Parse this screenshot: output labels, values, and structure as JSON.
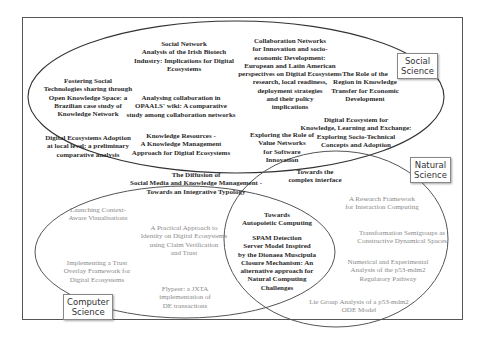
{
  "diagram": {
    "type": "venn",
    "sets": [
      {
        "id": "social",
        "label": "Social Science"
      },
      {
        "id": "natural",
        "label": "Natural Science"
      },
      {
        "id": "computer",
        "label": "Computer Science"
      }
    ],
    "social_only": [
      "Social Network Analysis of the Irish Biotech Industry: Implications for Digital Ecosystems",
      "Collaboration Networks for Innovation and socio-economic Development: European and Latin American perspectives on Digital Ecosystems research, local readiness, deployment strategies and their policy implications",
      "Fostering Social Technologies sharing through Open Knowledge Space: a Brazilian case study of Knowledge Network",
      "Analysing collaboration in OPAALS' wiki: A comparative study among collaboration networks",
      "The Role of the Region in Knowledge Transfer for Economic Development",
      "Digital Ecosystem for Knowledge, Learning and Exchange: Exploring Socio-Technical Concepts and Adoption",
      "Digital Ecosystems Adoption at local level: a preliminary comparative analysis",
      "Knowledge Resources - A Knowledge Management Approach for Digital Ecosystems",
      "Exploring the Role of Value Networks for Software Innovation"
    ],
    "social_computer": [
      "The Diffusion of Social Media and Knowledge Management - Towards an Integrative Typology"
    ],
    "social_natural": [
      "Towards the complex interface"
    ],
    "computer_natural": [
      "Towards Autopoietic Computing",
      "SPAM Detection Server Model Inspired by the Dionaea Muscipula Closure Mechanism: An alternative approach for Natural Computing Challenges"
    ],
    "computer_only": [
      "Launching Context-Aware Visualisations",
      "A Practical Approach to Identity on Digital Ecosystems using Claim Verification and Trust",
      "Implementing a Trust Overlay Framework for Digital Ecosystems",
      "Flypeer: a JXTA implementation of DE transactions"
    ],
    "natural_only": [
      "A Research Framework for Interaction Computing",
      "Transformation Semigroups as Constructive Dynamical Spaces",
      "Numerical and Experimental Analysis of the p53-mdm2 Regulatory Pathway",
      "Lie Group Analysis of a p53-mdm2 ODE Model"
    ]
  },
  "labels": {
    "social": [
      "Social",
      "Science"
    ],
    "natural": [
      "Natural",
      "Science"
    ],
    "computer": [
      "Computer",
      "Science"
    ]
  },
  "texts": {
    "sna": [
      "Social Network",
      "Analysis of the Irish Biotech",
      "Industry: Implications for Digital",
      "Ecosystems"
    ],
    "collab": [
      "Collaboration Networks",
      "for Innovation and socio-",
      "economic Development:",
      "European and Latin American",
      "perspectives on Digital Ecosystems",
      "research, local readiness,",
      "deployment strategies",
      "and their policy",
      "implications"
    ],
    "fostering": [
      "Fostering Social",
      "Technologies sharing through",
      "Open Knowledge Space: a",
      "Brazilian case study of",
      "Knowledge Network"
    ],
    "opaals": [
      "Analysing collaboration in",
      "OPAALS' wiki: A comparative",
      "study among collaboration networks"
    ],
    "region": [
      "The Role of the",
      "Region in Knowledge",
      "Transfer for Economic",
      "Development"
    ],
    "declex": [
      "Digital Ecosystem for",
      "Knowledge, Learning and Exchange:",
      "Exploring Socio-Technical",
      "Concepts and Adoption"
    ],
    "adoption": [
      "Digital Ecosystems Adoption",
      "at local level: a preliminary",
      "comparative analysis"
    ],
    "kres": [
      "Knowledge Resources -",
      "A Knowledge Management",
      "Approach for Digital Ecosystems"
    ],
    "value": [
      "Exploring the Role of",
      "Value Networks",
      "for Software",
      "Innovation"
    ],
    "diffusion": [
      "The Diffusion of",
      "Social Media and Knowledge Management -",
      "Towards an Integrative Typology"
    ],
    "complex": [
      "Towards the",
      "complex interface"
    ],
    "launch": [
      "Launching Context-",
      "Aware Visualisations"
    ],
    "identity": [
      "A Practical Approach to",
      "Identity on Digital Ecosystems",
      "using Claim Verification",
      "and Trust"
    ],
    "trust": [
      "Implementing a Trust",
      "Overlay Framework for",
      "Digital Ecosystems"
    ],
    "flypeer": [
      "Flypeer: a JXTA",
      "implementation of",
      "DE transactions"
    ],
    "autopoietic": [
      "Towards",
      "Autopoietic Computing"
    ],
    "spam": [
      "SPAM Detection",
      "Server Model Inspired",
      "by the Dionaea Muscipula",
      "Closure Mechanism: An",
      "alternative approach for",
      "Natural Computing",
      "Challenges"
    ],
    "research": [
      "A Research Framework",
      "for Interaction Computing"
    ],
    "semigroups": [
      "Transformation Semigroups as",
      "Constructive Dynamical Spaces"
    ],
    "numerical": [
      "Numerical and Experimental",
      "Analysis of the p53-mdm2",
      "Regulatory Pathway"
    ],
    "lie": [
      "Lie Group Analysis of a p53-mdm2",
      "ODE Model"
    ]
  }
}
